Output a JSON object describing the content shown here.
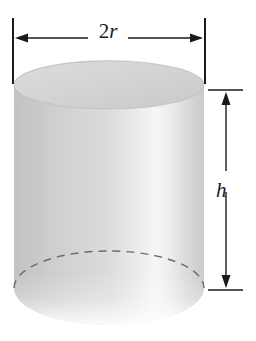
{
  "figure": {
    "shape": "cylinder",
    "background_color": "#ffffff",
    "line_color": "#1a1a1a"
  },
  "labels": {
    "diameter_number": "2",
    "diameter_variable": "r",
    "diameter_full": "2r",
    "height_variable": "h"
  },
  "dimensions": {
    "diameter_line": {
      "orientation": "horizontal",
      "position": "top",
      "arrowheads": "both",
      "label": "2r"
    },
    "height_line": {
      "orientation": "vertical",
      "position": "right",
      "arrowheads": "both",
      "label": "h"
    }
  },
  "solid": {
    "top_face": "ellipse",
    "hidden_back_edge": "dashed",
    "visible_front_edge": "solid",
    "shading": {
      "left": "#c6c6c6",
      "highlight": "#f4f4f4",
      "right": "#cfcfcf",
      "top_face": "#d6d6d6"
    }
  }
}
